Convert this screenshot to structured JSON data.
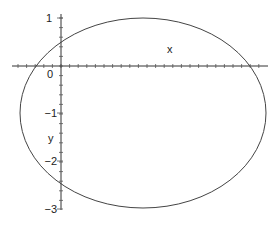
{
  "chart_data": {
    "type": "line",
    "title": "",
    "xlabel": "x",
    "ylabel": "y",
    "xlim": [
      -1.0,
      4.3
    ],
    "ylim": [
      -3.0,
      1.05
    ],
    "grid": false,
    "legend": null,
    "x_tick_labels": [
      "0"
    ],
    "y_tick_labels": [
      "1",
      "0",
      "-1",
      "-2",
      "-3"
    ],
    "y_ticks": [
      1,
      0,
      -1,
      -2,
      -3
    ],
    "series": [
      {
        "name": "curve",
        "shape": "ellipse",
        "center": [
          1.7,
          -1.0
        ],
        "semi_axis_x": 2.56,
        "semi_axis_y": 2.0,
        "x_intercepts": [
          -0.58,
          3.9
        ],
        "y_intercepts": [
          0.54,
          -2.5
        ],
        "color": "#333333"
      }
    ]
  },
  "axes": {
    "x_label": "x",
    "y_label": "y",
    "origin_label": "0",
    "y_labels": [
      "1",
      "-1",
      "-2",
      "-3"
    ]
  }
}
